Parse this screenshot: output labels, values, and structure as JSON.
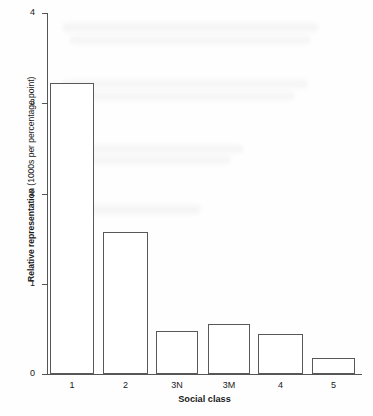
{
  "chart_data": {
    "type": "bar",
    "title": "",
    "subtitle": "",
    "xlabel": "Social class",
    "ylabel": "Relative representation (1000s per percentage point)",
    "ylabel_bold_part": "Relative representation",
    "ylabel_regular_part": " (1000s per percentage point)",
    "categories": [
      "1",
      "2",
      "3N",
      "3M",
      "4",
      "5"
    ],
    "values": [
      3.22,
      1.57,
      0.48,
      0.55,
      0.44,
      0.18
    ],
    "series": [
      {
        "name": "Relative representation",
        "values": [
          3.22,
          1.57,
          0.48,
          0.55,
          0.44,
          0.18
        ]
      }
    ],
    "ylim": [
      0,
      4
    ],
    "xlim_categories": 6,
    "ytick_labels": [
      "0",
      "1",
      "2",
      "3",
      "4"
    ],
    "ytick_values": [
      0,
      1,
      2,
      3,
      4
    ],
    "grid": false,
    "legend": false,
    "legend_position": "none",
    "bar_fill_color": "#ffffff",
    "bar_edge_color": "#585858",
    "axis_color": "#555555",
    "background_color": "#ffffff",
    "text_color": "#1a1a1a",
    "annotations": []
  }
}
